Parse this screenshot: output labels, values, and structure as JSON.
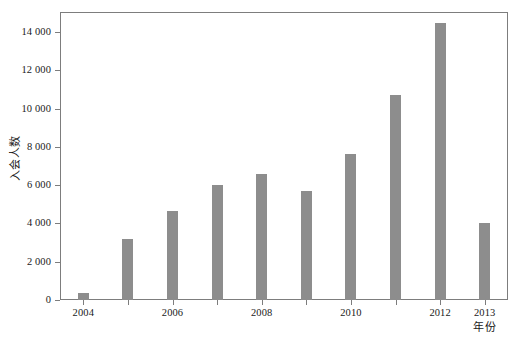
{
  "chart_data": {
    "type": "bar",
    "title": "",
    "subtitle": "",
    "xlabel": "年份",
    "ylabel": "入会人数",
    "categories": [
      "2004",
      "2005",
      "2006",
      "2007",
      "2008",
      "2009",
      "2010",
      "2011",
      "2012",
      "2013"
    ],
    "values": [
      370,
      3200,
      4650,
      6000,
      6600,
      5700,
      7650,
      10700,
      14500,
      4000
    ],
    "series": [
      {
        "name": "入会人数",
        "values": [
          370,
          3200,
          4650,
          6000,
          6600,
          5700,
          7650,
          10700,
          14500,
          4000
        ]
      }
    ],
    "ylim": [
      0,
      15000
    ],
    "xlim_categories": [
      "2004",
      "2013"
    ],
    "y_ticks": [
      0,
      2000,
      4000,
      6000,
      8000,
      10000,
      12000,
      14000
    ],
    "y_tick_labels": [
      "0",
      "2 000",
      "4 000",
      "6 000",
      "8 000",
      "10 000",
      "12 000",
      "14 000"
    ],
    "x_tick_labels_visible": [
      "2004",
      "2006",
      "2008",
      "2010",
      "2012",
      "2013"
    ],
    "x_tick_label_map": {
      "2004": "2004",
      "2005": "",
      "2006": "2006",
      "2007": "",
      "2008": "2008",
      "2009": "",
      "2010": "2010",
      "2011": "",
      "2012": "2012",
      "2013": "2013"
    },
    "grid": false,
    "legend": "none",
    "bar_color": "#8d8d8d",
    "axis_color": "#7d7d7d",
    "background_color": "#ffffff",
    "thousands_separator": " "
  }
}
